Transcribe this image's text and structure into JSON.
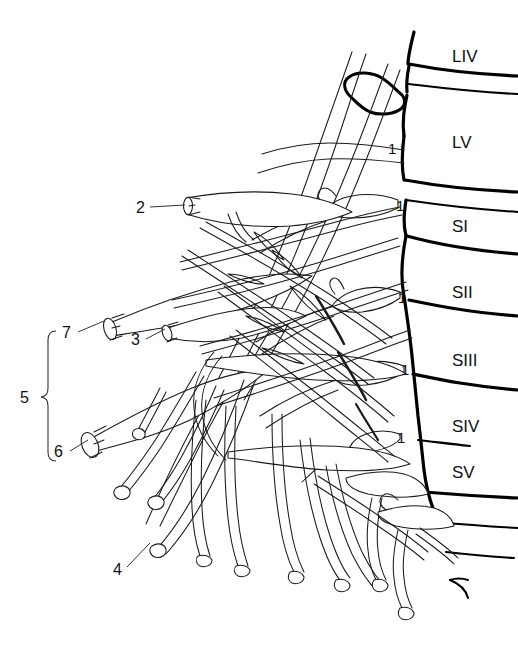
{
  "figure": {
    "kind": "anatomical-line-drawing",
    "background_color": "#ffffff",
    "ink_color": "#1a1a1a",
    "bone_color": "#000000",
    "width": 518,
    "height": 657
  },
  "vertebra_labels": [
    {
      "id": "LIV",
      "text": "LIV",
      "x": 452,
      "y": 62
    },
    {
      "id": "LV",
      "text": "LV",
      "x": 452,
      "y": 148
    },
    {
      "id": "SI",
      "text": "SI",
      "x": 452,
      "y": 232
    },
    {
      "id": "SII",
      "text": "SII",
      "x": 452,
      "y": 298
    },
    {
      "id": "SIII",
      "text": "SIII",
      "x": 452,
      "y": 366
    },
    {
      "id": "SIV",
      "text": "SIV",
      "x": 452,
      "y": 432
    },
    {
      "id": "SV",
      "text": "SV",
      "x": 452,
      "y": 478
    }
  ],
  "root_labels": [
    {
      "text": "1",
      "x": 391,
      "y": 154
    },
    {
      "text": "1",
      "x": 399,
      "y": 211
    },
    {
      "text": "1",
      "x": 401,
      "y": 303
    },
    {
      "text": "1",
      "x": 404,
      "y": 375
    },
    {
      "text": "1",
      "x": 400,
      "y": 443
    }
  ],
  "callouts": [
    {
      "text": "2",
      "x": 140,
      "y": 212,
      "leader": "M150,207 L185,205"
    },
    {
      "text": "7",
      "x": 64,
      "y": 337,
      "leader": "M76,333 L104,321"
    },
    {
      "text": "3",
      "x": 133,
      "y": 344,
      "leader": "M144,340 L166,327"
    },
    {
      "text": "6",
      "x": 58,
      "y": 456,
      "leader": "M68,452 L90,440"
    },
    {
      "text": "4",
      "x": 117,
      "y": 574,
      "leader": "M126,568 L148,542"
    }
  ],
  "bracket": {
    "label": "5",
    "label_x": 24,
    "label_y": 400,
    "top_y": 330,
    "bottom_y": 460,
    "x": 48
  }
}
